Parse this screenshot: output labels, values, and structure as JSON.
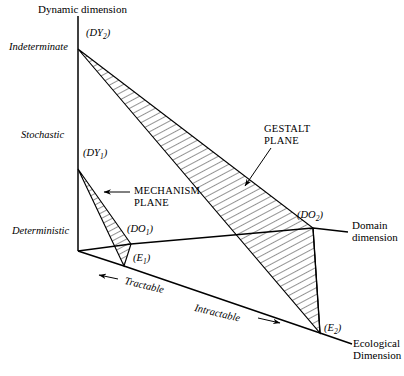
{
  "figure": {
    "title": "Dynamic dimension",
    "axes": {
      "dynamic_label": "Dynamic dimension",
      "domain_label_line1": "Domain",
      "domain_label_line2": "dimension",
      "ecological_label_line1": "Ecological",
      "ecological_label_line2": "Dimension"
    },
    "dynamic_scale": [
      {
        "label": "Indeterminate"
      },
      {
        "label": "Stochastic"
      },
      {
        "label": "Deterministic"
      }
    ],
    "ecological_scale": [
      {
        "label": "Tractable",
        "arrow": "left-arrow-icon"
      },
      {
        "label": "Intractable",
        "arrow": "right-arrow-icon"
      }
    ],
    "planes": [
      {
        "name": "gestalt",
        "label_line1": "GESTALT",
        "label_line2": "PLANE",
        "leader": "gestalt-leader-line"
      },
      {
        "name": "mechanism",
        "label_line1": "MECHANISM",
        "label_line2": "PLANE",
        "leader": "mechanism-arrow-icon"
      }
    ],
    "vertices": [
      {
        "id": "DY2",
        "base": "DY",
        "sub": "2"
      },
      {
        "id": "DY1",
        "base": "DY",
        "sub": "1"
      },
      {
        "id": "DO1",
        "base": "DO",
        "sub": "1"
      },
      {
        "id": "E1",
        "base": "E",
        "sub": "1"
      },
      {
        "id": "DO2",
        "base": "DO",
        "sub": "2"
      },
      {
        "id": "E2",
        "base": "E",
        "sub": "2"
      }
    ],
    "colors": {
      "ink": "#000000",
      "background": "#ffffff",
      "hatch": "#000000"
    }
  }
}
